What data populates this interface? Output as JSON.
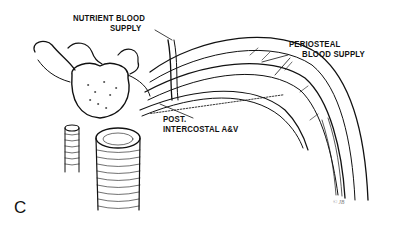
{
  "figure": {
    "panel_letter": "C",
    "signature": "© JB",
    "labels": {
      "nutrient": [
        "NUTRIENT BLOOD",
        "SUPPLY"
      ],
      "periosteal": [
        "PERIOSTEAL",
        "BLOOD SUPPLY"
      ],
      "intercostal": [
        "POST.",
        "INTERCOSTAL A&V"
      ]
    },
    "colors": {
      "ink": "#111111",
      "background": "#ffffff"
    }
  }
}
